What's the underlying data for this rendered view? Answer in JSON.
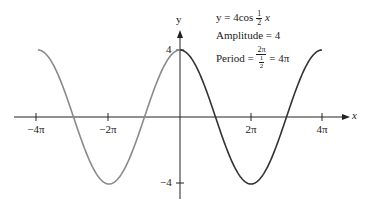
{
  "chart_data": {
    "type": "line",
    "title": "",
    "function": "y = 4cos(x/2)",
    "xlabel": "x",
    "ylabel": "y",
    "xlim": [
      -4.4,
      5.0
    ],
    "ylim": [
      -4.7,
      5.3
    ],
    "x_units": "pi",
    "x_ticks": [
      -4,
      -2,
      2,
      4
    ],
    "x_tick_labels": [
      "−4π",
      "−2π",
      "2π",
      "4π"
    ],
    "y_ticks": [
      4,
      -4
    ],
    "y_tick_labels": [
      "4",
      "−4"
    ],
    "grid": false,
    "series": [
      {
        "name": "4cos(x/2) for x in [-4π, 0]",
        "color": "#8a8a8a",
        "x_range_pi": [
          -4,
          0
        ],
        "amplitude": 4,
        "period_pi": 4
      },
      {
        "name": "4cos(x/2) for x in [0, 4π] (one period)",
        "color": "#333333",
        "x_range_pi": [
          0,
          4
        ],
        "amplitude": 4,
        "period_pi": 4
      }
    ],
    "key_points": [
      {
        "x_pi": -4,
        "y": 4
      },
      {
        "x_pi": -3,
        "y": 0
      },
      {
        "x_pi": -2,
        "y": -4
      },
      {
        "x_pi": -1,
        "y": 0
      },
      {
        "x_pi": 0,
        "y": 4
      },
      {
        "x_pi": 1,
        "y": 0
      },
      {
        "x_pi": 2,
        "y": -4
      },
      {
        "x_pi": 3,
        "y": 0
      },
      {
        "x_pi": 4,
        "y": 4
      }
    ],
    "annotations": {
      "equation": "y = 4cos ½x",
      "amplitude": "Amplitude = 4",
      "period": "Period = 2π / (1/2) = 4π"
    }
  },
  "labels": {
    "x_axis": "x",
    "y_axis": "y",
    "x_ticks": [
      "−4π",
      "−2π",
      "2π",
      "4π"
    ],
    "y_tick_pos": "4",
    "y_tick_neg": "−4",
    "eq_prefix": "y = 4cos",
    "eq_num": "1",
    "eq_den": "2",
    "eq_var": "x",
    "amplitude": "Amplitude = 4",
    "period_prefix": "Period =",
    "period_num": "2π",
    "period_den_num": "1",
    "period_den_den": "2",
    "period_result": "= 4π"
  }
}
